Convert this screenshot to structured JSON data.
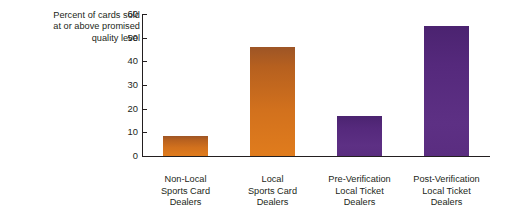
{
  "chart_data": {
    "type": "bar",
    "title": "",
    "subtitle": "",
    "xlabel": "",
    "ylabel": "Percent of cards sold at or above promised quality level",
    "ylabel_lines": [
      "Percent of cards sold",
      "at or above promised",
      "quality level"
    ],
    "categories": [
      "Non-Local Sports Card Dealers",
      "Local Sports Card Dealers",
      "Pre-Verification Local Ticket Dealers",
      "Post-Verification Local Ticket Dealers"
    ],
    "category_lines": [
      [
        "Non-Local",
        "Sports Card",
        "Dealers"
      ],
      [
        "Local",
        "Sports Card",
        "Dealers"
      ],
      [
        "Pre-Verification",
        "Local Ticket",
        "Dealers"
      ],
      [
        "Post-Verification",
        "Local Ticket",
        "Dealers"
      ]
    ],
    "values": [
      8.5,
      46,
      17,
      55
    ],
    "bar_colors": [
      "#c26a28",
      "#c96c1f",
      "#5b2d82",
      "#5b2d82"
    ],
    "ylim": [
      0,
      60
    ],
    "yticks": [
      0,
      10,
      20,
      30,
      40,
      50,
      60
    ],
    "ytick_labels": [
      "0",
      "10",
      "20",
      "30",
      "40",
      "50",
      "60"
    ],
    "grid": false,
    "legend": null,
    "axis_color": "#231f20",
    "background": "#ffffff"
  }
}
